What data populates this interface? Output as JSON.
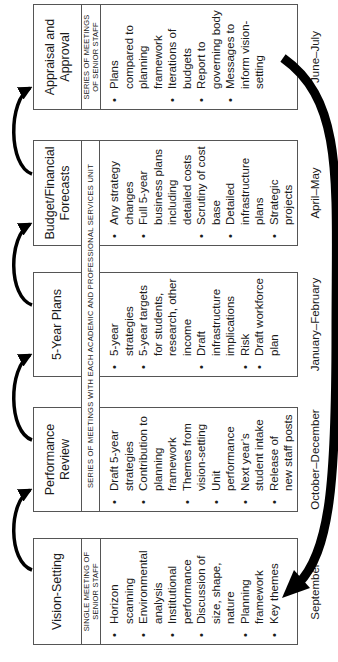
{
  "stages": [
    {
      "title": "Vision-Setting",
      "series": "SINGLE MEETING OF SENIOR STAFF",
      "items": [
        "Horizon scanning",
        "Environmental analysis",
        "Institutional performance",
        "Discussion of size, shape, nature",
        "Planning framework",
        "Key themes"
      ],
      "date": "September"
    },
    {
      "title": "Performance Review",
      "series": "",
      "items": [
        "Draft 5-year strategies",
        "Contribution to planning framework",
        "Themes from vision-setting",
        "Unit performance",
        "Next year’s student intake",
        "Release of new staff posts"
      ],
      "date": "October–December"
    },
    {
      "title": "5-Year Plans",
      "series": "",
      "items": [
        "5-year strategies",
        "5-year targets for students, research, other income",
        "Draft infrastructure implications",
        "Risk",
        "Draft workforce plan"
      ],
      "date": "January–February"
    },
    {
      "title": "Budget/Financial Forecasts",
      "series": "",
      "items": [
        "Any strategy changes",
        "Full 5-year business plans including detailed costs",
        "Scrutiny of cost base",
        "Detailed infrastructure plans",
        "Strategic projects"
      ],
      "date": "April–May"
    },
    {
      "title": "Appraisal and Approval",
      "series": "SERIES OF MEETINGS OF SENIOR STAFF",
      "items": [
        "Plans compared to planning framework",
        "Iterations of budgets",
        "Report to governing body",
        "Messages to inform vision-setting"
      ],
      "date": "June–July"
    }
  ],
  "shared_series": "SERIES OF MEETINGS WITH EACH ACADEMIC AND PROFESSIONAL SERVICES UNIT",
  "colors": {
    "line": "#555555",
    "arrow": "#000000",
    "text": "#1a1a1a"
  }
}
